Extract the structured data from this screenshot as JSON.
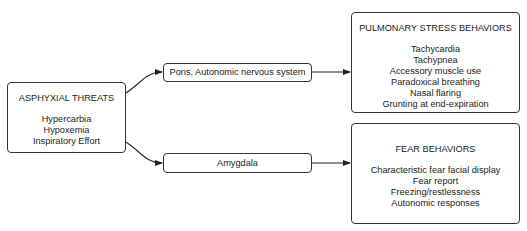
{
  "diagram": {
    "source": {
      "title": "ASPHYXIAL THREATS",
      "items": [
        "Hypercarbia",
        "Hypoxemia",
        "Inspiratory Effort"
      ]
    },
    "pathways": [
      {
        "label": "Pons, Autonomic nervous system"
      },
      {
        "label": "Amygdala"
      }
    ],
    "outcomes": [
      {
        "title": "PULMONARY STRESS BEHAVIORS",
        "items": [
          "Tachycardia",
          "Tachypnea",
          "Accessory muscle use",
          "Paradoxical breathing",
          "Nasal flaring",
          "Grunting at end-expiration"
        ]
      },
      {
        "title": "FEAR BEHAVIORS",
        "items": [
          "Characteristic fear facial display",
          "Fear report",
          "Freezing/restlessness",
          "Autonomic responses"
        ]
      }
    ],
    "edges": [
      {
        "from": "ASPHYXIAL THREATS",
        "to": "Pons, Autonomic nervous system"
      },
      {
        "from": "ASPHYXIAL THREATS",
        "to": "Amygdala"
      },
      {
        "from": "Pons, Autonomic nervous system",
        "to": "PULMONARY STRESS BEHAVIORS"
      },
      {
        "from": "Amygdala",
        "to": "FEAR BEHAVIORS"
      }
    ],
    "colors": {
      "stroke": "#333333",
      "text": "#222222",
      "background": "#ffffff"
    }
  }
}
